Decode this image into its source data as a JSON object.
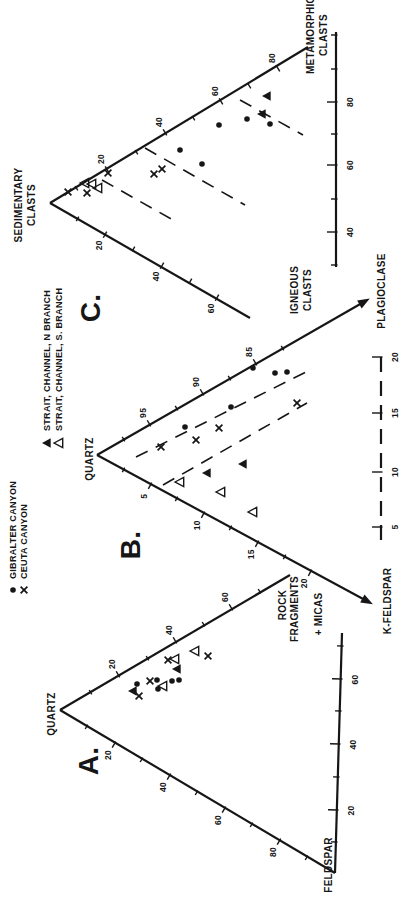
{
  "colors": {
    "ink": "#161616",
    "paper": "#ffffff"
  },
  "chart_data": {
    "type": "ternary-scatter-triptych",
    "orientation": "landscape figure rotated 90deg CCW on portrait page",
    "series": [
      {
        "id": "gibralter",
        "marker": "dot",
        "label": "GIBRALTER CANYON"
      },
      {
        "id": "ceuta",
        "marker": "x",
        "label": "CEUTA CANYON"
      },
      {
        "id": "nbranch",
        "marker": "tri-filled",
        "label": "STRAIT, CHANNEL, N BRANCH"
      },
      {
        "id": "sbranch",
        "marker": "tri-open",
        "label": "STRAIT, CHANNEL, S. BRANCH"
      }
    ],
    "legend": {
      "items": [
        {
          "series": "gibralter",
          "marker": "dot",
          "mx": 321,
          "my": 13,
          "tx": 332,
          "label": "GIBRALTER CANYON"
        },
        {
          "series": "ceuta",
          "marker": "x",
          "mx": 321,
          "my": 24,
          "tx": 332,
          "label": "CEUTA CANYON"
        },
        {
          "series": "nbranch",
          "marker": "tri-filled",
          "mx": 468,
          "my": 47,
          "tx": 480,
          "label": "STRAIT, CHANNEL, N BRANCH"
        },
        {
          "series": "sbranch",
          "marker": "tri-open",
          "mx": 468,
          "my": 59,
          "tx": 480,
          "label": "STRAIT, CHANNEL, S. BRANCH"
        }
      ]
    },
    "diagrams": [
      {
        "id": "A",
        "apex": "QUARTZ",
        "corners": [
          "QUARTZ",
          "FELDSPAR",
          "ROCK FRAGMENTS + MICAS"
        ],
        "texts": [
          {
            "text": "A.",
            "x": 150,
            "y": 88,
            "size": 28,
            "name": "diagram-a-title"
          },
          {
            "text": "QUARTZ",
            "x": 197,
            "y": 51,
            "size": 10,
            "name": "a-apex-label-quartz"
          },
          {
            "text": "FELDSPAR",
            "x": 46,
            "y": 328,
            "size": 10,
            "name": "a-vertex-label-feldspar"
          },
          {
            "text": "ROCK",
            "x": 306,
            "y": 282,
            "size": 10,
            "name": "a-vertex-label-rock"
          },
          {
            "text": "FRAGMENTS",
            "x": 302,
            "y": 294,
            "size": 10,
            "name": "a-vertex-label-fragments"
          },
          {
            "text": "+ MICAS",
            "x": 297,
            "y": 318,
            "size": 10,
            "name": "a-vertex-label-micas"
          }
        ],
        "axes": [
          {
            "x1": 201,
            "y1": 60,
            "x2": 336,
            "y2": 290,
            "nx": 0.862,
            "ny": -0.506,
            "side": 1,
            "ticks": [
              {
                "x": 235,
                "y": 119,
                "label": "20"
              },
              {
                "x": 269,
                "y": 176,
                "label": "40"
              },
              {
                "x": 302,
                "y": 232,
                "label": "60"
              },
              {
                "x": 218,
                "y": 91
              },
              {
                "x": 252,
                "y": 148
              },
              {
                "x": 286,
                "y": 204
              },
              {
                "x": 319,
                "y": 260
              }
            ]
          },
          {
            "x1": 201,
            "y1": 60,
            "x2": 38,
            "y2": 335,
            "nx": -0.86,
            "ny": -0.51,
            "side": 1,
            "ticks": [
              {
                "x": 168,
                "y": 115,
                "label": "20"
              },
              {
                "x": 136,
                "y": 170,
                "label": "40"
              },
              {
                "x": 103,
                "y": 225,
                "label": "60"
              },
              {
                "x": 71,
                "y": 280,
                "label": "80"
              },
              {
                "x": 185,
                "y": 87
              },
              {
                "x": 152,
                "y": 142
              },
              {
                "x": 119,
                "y": 197
              },
              {
                "x": 87,
                "y": 252
              },
              {
                "x": 54,
                "y": 307
              }
            ]
          },
          {
            "x1": 38,
            "y1": 335,
            "x2": 278,
            "y2": 342,
            "bar": true,
            "nx": 0.03,
            "ny": -1,
            "side": -1,
            "ticks": [
              {
                "x": 101,
                "y": 337,
                "label": "20"
              },
              {
                "x": 167,
                "y": 339,
                "label": "40"
              },
              {
                "x": 232,
                "y": 341,
                "label": "60"
              },
              {
                "x": 69,
                "y": 336
              },
              {
                "x": 134,
                "y": 338
              },
              {
                "x": 200,
                "y": 340
              },
              {
                "x": 265,
                "y": 342
              }
            ]
          }
        ],
        "separators": [],
        "points": [
          {
            "series": "gibralter",
            "x": 231,
            "y": 157
          },
          {
            "series": "gibralter",
            "x": 227,
            "y": 137
          },
          {
            "series": "gibralter",
            "x": 222,
            "y": 158
          },
          {
            "series": "gibralter",
            "x": 230,
            "y": 172
          },
          {
            "series": "gibralter",
            "x": 231,
            "y": 179
          },
          {
            "series": "ceuta",
            "x": 255,
            "y": 208
          },
          {
            "series": "ceuta",
            "x": 251,
            "y": 168
          },
          {
            "series": "ceuta",
            "x": 230,
            "y": 150
          },
          {
            "series": "ceuta",
            "x": 215,
            "y": 139
          },
          {
            "series": "nbranch",
            "x": 242,
            "y": 177
          },
          {
            "series": "nbranch",
            "x": 220,
            "y": 133
          },
          {
            "series": "sbranch",
            "x": 260,
            "y": 195
          },
          {
            "series": "sbranch",
            "x": 252,
            "y": 175
          },
          {
            "series": "sbranch",
            "x": 225,
            "y": 163
          }
        ]
      },
      {
        "id": "B",
        "apex": "QUARTZ",
        "corners": [
          "QUARTZ",
          "K-FELDSPAR",
          "PLAGIOCLASE"
        ],
        "texts": [
          {
            "text": "B.",
            "x": 366,
            "y": 130,
            "size": 28,
            "name": "diagram-b-title"
          },
          {
            "text": "QUARTZ",
            "x": 452,
            "y": 89,
            "size": 10,
            "name": "b-apex-label-quartz"
          },
          {
            "text": "K-FELDSPAR",
            "x": 310,
            "y": 387,
            "size": 10,
            "name": "b-vertex-label-k-feldspar"
          },
          {
            "text": "PLAGIOCLASE",
            "x": 620,
            "y": 381,
            "size": 10,
            "name": "b-vertex-label-plagioclase"
          }
        ],
        "axes": [
          {
            "x1": 456,
            "y1": 97,
            "x2": 608,
            "y2": 362,
            "arrow": true,
            "nx": 0.868,
            "ny": -0.497,
            "side": 1,
            "ticks": [
              {
                "x": 486,
                "y": 150,
                "label": "95"
              },
              {
                "x": 517,
                "y": 203,
                "label": "90"
              },
              {
                "x": 547,
                "y": 256,
                "label": "85"
              },
              {
                "x": 471,
                "y": 124
              },
              {
                "x": 502,
                "y": 177
              },
              {
                "x": 532,
                "y": 230
              },
              {
                "x": 562,
                "y": 283
              }
            ]
          },
          {
            "x1": 456,
            "y1": 97,
            "x2": 311,
            "y2": 365,
            "arrow": true,
            "nx": -0.879,
            "ny": -0.476,
            "side": 1,
            "ticks": [
              {
                "x": 427,
                "y": 151,
                "label": "5"
              },
              {
                "x": 398,
                "y": 204,
                "label": "10"
              },
              {
                "x": 369,
                "y": 258,
                "label": "15"
              },
              {
                "x": 340,
                "y": 311,
                "label": "20"
              },
              {
                "x": 442,
                "y": 124
              },
              {
                "x": 413,
                "y": 177
              },
              {
                "x": 384,
                "y": 231
              },
              {
                "x": 355,
                "y": 285
              }
            ]
          },
          {
            "x1": 371,
            "y1": 381,
            "x2": 561,
            "y2": 381,
            "bar": true,
            "dash": true,
            "nx": 0,
            "ny": -1,
            "side": -1,
            "ticks": [
              {
                "x": 384,
                "y": 381,
                "label": "5"
              },
              {
                "x": 439,
                "y": 381,
                "label": "10"
              },
              {
                "x": 498,
                "y": 381,
                "label": "15"
              },
              {
                "x": 554,
                "y": 381,
                "label": "20"
              }
            ]
          }
        ],
        "separators": [
          [
            454,
            136,
            540,
            308
          ],
          [
            426,
            163,
            508,
            307
          ]
        ],
        "points": [
          {
            "series": "gibralter",
            "x": 484,
            "y": 185
          },
          {
            "series": "gibralter",
            "x": 504,
            "y": 231
          },
          {
            "series": "gibralter",
            "x": 543,
            "y": 253
          },
          {
            "series": "gibralter",
            "x": 538,
            "y": 275
          },
          {
            "series": "gibralter",
            "x": 539,
            "y": 287
          },
          {
            "series": "ceuta",
            "x": 464,
            "y": 161
          },
          {
            "series": "ceuta",
            "x": 471,
            "y": 196
          },
          {
            "series": "ceuta",
            "x": 483,
            "y": 219
          },
          {
            "series": "ceuta",
            "x": 508,
            "y": 297
          },
          {
            "series": "nbranch",
            "x": 438,
            "y": 207
          },
          {
            "series": "nbranch",
            "x": 447,
            "y": 243
          },
          {
            "series": "sbranch",
            "x": 429,
            "y": 180
          },
          {
            "series": "sbranch",
            "x": 419,
            "y": 221
          },
          {
            "series": "sbranch",
            "x": 399,
            "y": 253
          }
        ]
      },
      {
        "id": "C",
        "apex": "SEDIMENTARY CLASTS",
        "corners": [
          "SEDIMENTARY CLASTS",
          "IGNEOUS CLASTS",
          "METAMORPHIC CLASTS"
        ],
        "texts": [
          {
            "text": "C.",
            "x": 603,
            "y": 90,
            "size": 28,
            "name": "diagram-c-title"
          },
          {
            "text": "SEDIMENTARY",
            "x": 706,
            "y": 18,
            "size": 10,
            "name": "c-apex-label-sedimentary"
          },
          {
            "text": "CLASTS",
            "x": 706,
            "y": 31,
            "size": 10,
            "name": "c-apex-label-sedimentary-clasts"
          },
          {
            "text": "IGNEOUS",
            "x": 621,
            "y": 294,
            "size": 10,
            "name": "c-vertex-label-igneous"
          },
          {
            "text": "CLASTS",
            "x": 621,
            "y": 307,
            "size": 10,
            "name": "c-vertex-label-igneous-clasts"
          },
          {
            "text": "METAMORPHIC",
            "x": 876,
            "y": 310,
            "size": 10,
            "name": "c-vertex-label-metamorphic"
          },
          {
            "text": "CLASTS",
            "x": 876,
            "y": 323,
            "size": 10,
            "name": "c-vertex-label-metamorphic-clasts"
          }
        ],
        "axes": [
          {
            "x1": 708,
            "y1": 50,
            "x2": 864,
            "y2": 308,
            "nx": 0.856,
            "ny": -0.517,
            "side": 1,
            "ticks": [
              {
                "x": 740,
                "y": 108,
                "label": "20"
              },
              {
                "x": 777,
                "y": 166,
                "label": "40"
              },
              {
                "x": 808,
                "y": 222,
                "label": "60"
              },
              {
                "x": 841,
                "y": 279,
                "label": "80"
              },
              {
                "x": 722,
                "y": 77
              },
              {
                "x": 758,
                "y": 137
              },
              {
                "x": 792,
                "y": 194
              },
              {
                "x": 824,
                "y": 250
              }
            ]
          },
          {
            "x1": 708,
            "y1": 50,
            "x2": 593,
            "y2": 250,
            "nx": -0.866,
            "ny": -0.498,
            "side": 1,
            "ticks": [
              {
                "x": 678,
                "y": 106,
                "label": "20"
              },
              {
                "x": 647,
                "y": 163,
                "label": "40"
              },
              {
                "x": 615,
                "y": 218,
                "label": "60"
              },
              {
                "x": 693,
                "y": 78
              },
              {
                "x": 663,
                "y": 134
              },
              {
                "x": 631,
                "y": 191
              }
            ]
          },
          {
            "x1": 644,
            "y1": 336,
            "x2": 879,
            "y2": 336,
            "bar": true,
            "nx": 0,
            "ny": -1,
            "side": -1,
            "ticks": [
              {
                "x": 679,
                "y": 336,
                "label": "40"
              },
              {
                "x": 746,
                "y": 336,
                "label": "60"
              },
              {
                "x": 809,
                "y": 336,
                "label": "80"
              },
              {
                "x": 646,
                "y": 336
              },
              {
                "x": 712,
                "y": 336
              },
              {
                "x": 777,
                "y": 336
              },
              {
                "x": 842,
                "y": 336
              },
              {
                "x": 876,
                "y": 336
              }
            ]
          }
        ],
        "separators": [
          [
            811,
            240,
            776,
            303
          ],
          [
            763,
            145,
            706,
            245
          ],
          [
            731,
            102,
            691,
            173
          ]
        ],
        "points": [
          {
            "series": "ceuta",
            "x": 719,
            "y": 68
          },
          {
            "series": "ceuta",
            "x": 718,
            "y": 87
          },
          {
            "series": "ceuta",
            "x": 738,
            "y": 108
          },
          {
            "series": "ceuta",
            "x": 737,
            "y": 154
          },
          {
            "series": "ceuta",
            "x": 742,
            "y": 162
          },
          {
            "series": "gibralter",
            "x": 761,
            "y": 180
          },
          {
            "series": "gibralter",
            "x": 747,
            "y": 202
          },
          {
            "series": "gibralter",
            "x": 786,
            "y": 219
          },
          {
            "series": "gibralter",
            "x": 792,
            "y": 247
          },
          {
            "series": "gibralter",
            "x": 787,
            "y": 270
          },
          {
            "series": "nbranch",
            "x": 815,
            "y": 267
          },
          {
            "series": "nbranch",
            "x": 797,
            "y": 262
          },
          {
            "series": "sbranch",
            "x": 728,
            "y": 85
          },
          {
            "series": "sbranch",
            "x": 727,
            "y": 92
          },
          {
            "series": "sbranch",
            "x": 723,
            "y": 98
          }
        ]
      }
    ]
  }
}
